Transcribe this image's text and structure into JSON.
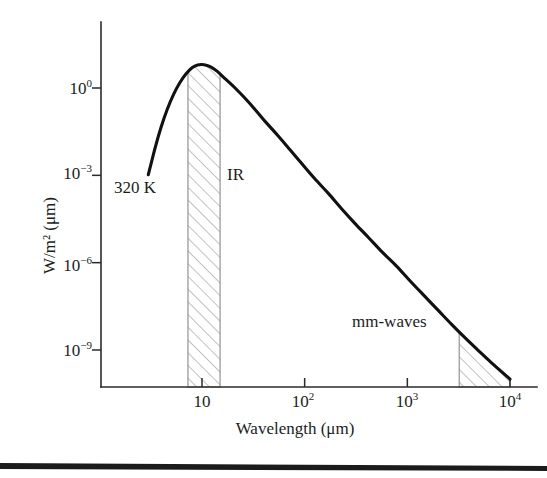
{
  "figure": {
    "background_color": "#ffffff",
    "curve_color": "#111111",
    "axis_color": "#2b2b2b",
    "hatch_color": "#8a8a8a",
    "bottom_rule_color": "#1b1b1b"
  },
  "chart_data": {
    "type": "line",
    "title": "",
    "subtitle": "",
    "xlabel": "Wavelength (μm)",
    "ylabel": "W/m² (μm)",
    "xscale": "log",
    "yscale": "log",
    "xlim": [
      2.2,
      14000
    ],
    "ylim": [
      1e-11,
      50
    ],
    "grid": false,
    "legend": false,
    "x_tick_labels": [
      "10",
      "10²",
      "10³",
      "10⁴"
    ],
    "x_tick_values": [
      10,
      100,
      1000,
      10000
    ],
    "y_tick_labels": [
      "10⁰",
      "10⁻³",
      "10⁻⁶",
      "10⁻⁹"
    ],
    "y_tick_values": [
      1,
      0.001,
      1e-06,
      1e-09
    ],
    "series": [
      {
        "name": "Blackbody spectral radiance at 320 K",
        "temperature_k": 320,
        "x": [
          3.0,
          3.5,
          4.0,
          4.6,
          5.3,
          6.1,
          7.0,
          8.0,
          9.05,
          10.5,
          12.0,
          14.0,
          17.0,
          21.0,
          26.0,
          33.0,
          42.0,
          55.0,
          72.0,
          95.0,
          125.0,
          170.0,
          230.0,
          310.0,
          420.0,
          570.0,
          780.0,
          1060.0,
          1450.0,
          2000.0,
          2700.0,
          3700.0,
          5100.0,
          7000.0,
          10000.0
        ],
        "y": [
          0.00105,
          0.009,
          0.046,
          0.19,
          0.62,
          1.55,
          3.1,
          5.0,
          6.2,
          6.3,
          5.4,
          3.8,
          2.0,
          1.0,
          0.46,
          0.18,
          0.066,
          0.023,
          0.0076,
          0.0024,
          0.00078,
          0.00024,
          7e-05,
          2.2e-05,
          7.2e-06,
          2.3e-06,
          7.8e-07,
          2.4e-07,
          7.5e-08,
          2.3e-08,
          7.6e-09,
          2.5e-09,
          8.5e-10,
          3e-10,
          1e-10
        ],
        "peak_wavelength_um": 9.05,
        "peak_value": 6.3
      }
    ],
    "shaded_bands": [
      {
        "name": "IR",
        "label": "IR",
        "x_start": 7.3,
        "x_end": 15.0,
        "hatch": "diagonal-45",
        "fill": "hatched"
      },
      {
        "name": "mm-waves",
        "label": "mm-waves",
        "x_start": 3200,
        "x_end": 10000,
        "hatch": "diagonal-45",
        "fill": "hatched"
      }
    ],
    "annotations": [
      {
        "name": "temperature",
        "text": "320 K",
        "x": 3.3,
        "y": 0.00012
      },
      {
        "name": "ir-band",
        "text": "IR",
        "x": 17.5,
        "y": 0.0002
      },
      {
        "name": "mm-waves-band",
        "text": "mm-waves",
        "x": 1100,
        "y": 1.6e-08
      }
    ]
  },
  "axes": {
    "y_ticks": [
      {
        "mantissa": "10",
        "exponent": "0"
      },
      {
        "mantissa": "10",
        "exponent": "−3"
      },
      {
        "mantissa": "10",
        "exponent": "−6"
      },
      {
        "mantissa": "10",
        "exponent": "−9"
      }
    ],
    "x_ticks": [
      {
        "mantissa": "10",
        "exponent": ""
      },
      {
        "mantissa": "10",
        "exponent": "2"
      },
      {
        "mantissa": "10",
        "exponent": "3"
      },
      {
        "mantissa": "10",
        "exponent": "4"
      }
    ],
    "x_title": "Wavelength (μm)",
    "y_title": "W/m² (μm)"
  },
  "annotations": {
    "temperature": "320 K",
    "ir": "IR",
    "mm_waves": "mm-waves"
  }
}
